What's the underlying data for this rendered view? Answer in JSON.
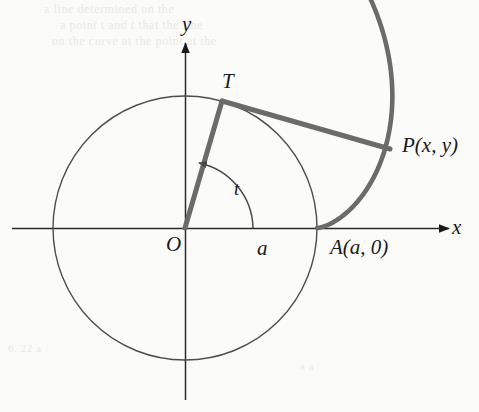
{
  "figure": {
    "type": "geometry-diagram",
    "background_color": "#fbfbfa",
    "ink_color": "#1a1a1a",
    "accent_color": "#6b6b6b",
    "thin_stroke_color": "#555555"
  },
  "labels": {
    "y_axis": "y",
    "x_axis": "x",
    "tangent_point": "T",
    "origin": "O",
    "radius_label": "a",
    "angle": "t",
    "point_p": "P(x,  y)",
    "point_a": "A(a,  0)"
  },
  "geometry": {
    "origin_px": [
      185,
      228
    ],
    "circle_radius_px": 132,
    "tangent_point_px": [
      222,
      101
    ],
    "point_a_px": [
      317,
      228
    ],
    "point_p_px": [
      389,
      149
    ],
    "involute_end_px": [
      404,
      82
    ],
    "angle_t_degrees": 74,
    "x_axis_span_px": [
      12,
      452
    ],
    "y_axis_span_px": [
      40,
      400
    ]
  },
  "bleed_text": {
    "line1": "a line determined on the",
    "line2": "a point t and t      that the line",
    "line3": "on the curve at the point at the",
    "line4": "6. 22 a",
    "line5": "a a"
  },
  "chart_data": {
    "type": "line",
    "title": "",
    "xlabel": "x",
    "ylabel": "y",
    "grid": false,
    "legend": "none",
    "series": [
      {
        "name": "circle",
        "description": "circle of radius a centred at the origin O",
        "center": [
          0,
          0
        ],
        "radius": 1.0
      },
      {
        "name": "involute",
        "description": "involute of the circle starting at A(a, 0), parametrized by x = a(cos t + t sin t), y = a(sin t - t cos t)",
        "t_range": [
          0,
          2.1
        ]
      },
      {
        "name": "radius OT",
        "description": "radius from origin O to tangent point T at angle t",
        "from": [
          0,
          0
        ],
        "to": [
          0.28,
          0.96
        ]
      },
      {
        "name": "string TP",
        "description": "taut unwound string segment from T to P, of length a*t, tangent to the circle at T",
        "from": [
          0.28,
          0.96
        ],
        "to": [
          1.55,
          0.6
        ]
      }
    ],
    "annotations": [
      {
        "text": "T",
        "at": [
          0.28,
          0.96
        ]
      },
      {
        "text": "O",
        "at": [
          0,
          0
        ]
      },
      {
        "text": "a",
        "at": [
          0.55,
          -0.07
        ]
      },
      {
        "text": "t",
        "at": [
          0.37,
          0.38
        ]
      },
      {
        "text": "P(x,  y)",
        "at": [
          1.55,
          0.6
        ]
      },
      {
        "text": "A(a,  0)",
        "at": [
          1.0,
          -0.07
        ]
      }
    ]
  }
}
